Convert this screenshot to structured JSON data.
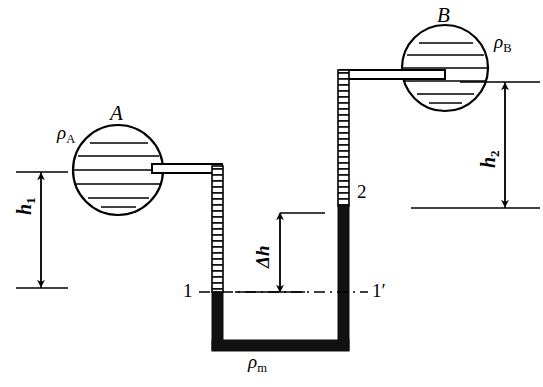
{
  "diagram": {
    "vessel_a": {
      "name_label": "A",
      "density_label": "ρ",
      "density_sub": "A",
      "icon": "sphere-vessel-icon",
      "fill_lines": 6
    },
    "vessel_b": {
      "name_label": "B",
      "density_label": "ρ",
      "density_sub": "B",
      "icon": "sphere-vessel-icon",
      "fill_lines": 6
    },
    "manometer": {
      "fluid_density_label": "ρ",
      "fluid_density_sub": "m",
      "point_left_label": "1",
      "point_right_label": "1′",
      "point_two_label": "2"
    },
    "dimensions": [
      {
        "name": "h1",
        "symbol": "h",
        "sub": "1"
      },
      {
        "name": "h2",
        "symbol": "h",
        "sub": "2"
      },
      {
        "name": "dh",
        "symbol": "Δh",
        "sub": ""
      }
    ],
    "colors": {
      "stroke": "#000000",
      "background": "#ffffff",
      "mercury_fill": "#111111",
      "empty_tube_fill": "#ffffff"
    }
  }
}
